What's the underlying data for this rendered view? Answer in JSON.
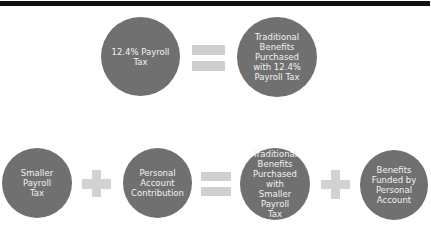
{
  "diagram": {
    "colors": {
      "circle": "#707070",
      "operator": "#cfcfcf",
      "text": "#f2f2f2",
      "topbar": "#111111"
    },
    "row1": {
      "items": [
        {
          "type": "circle",
          "label": "12.4% Payroll\nTax"
        },
        {
          "type": "operator",
          "symbol": "="
        },
        {
          "type": "circle",
          "label": "Traditional\nBenefits\nPurchased\nwith 12.4%\nPayroll Tax"
        }
      ]
    },
    "row2": {
      "items": [
        {
          "type": "circle",
          "label": "Smaller Payroll\nTax"
        },
        {
          "type": "operator",
          "symbol": "+"
        },
        {
          "type": "circle",
          "label": "Personal\nAccount\nContribution"
        },
        {
          "type": "operator",
          "symbol": "="
        },
        {
          "type": "circle",
          "label": "Traditional\nBenefits\nPurchased with\nSmaller Payroll\nTax"
        },
        {
          "type": "operator",
          "symbol": "+"
        },
        {
          "type": "circle",
          "label": "Benefits\nFunded by\nPersonal\nAccount"
        }
      ]
    }
  }
}
